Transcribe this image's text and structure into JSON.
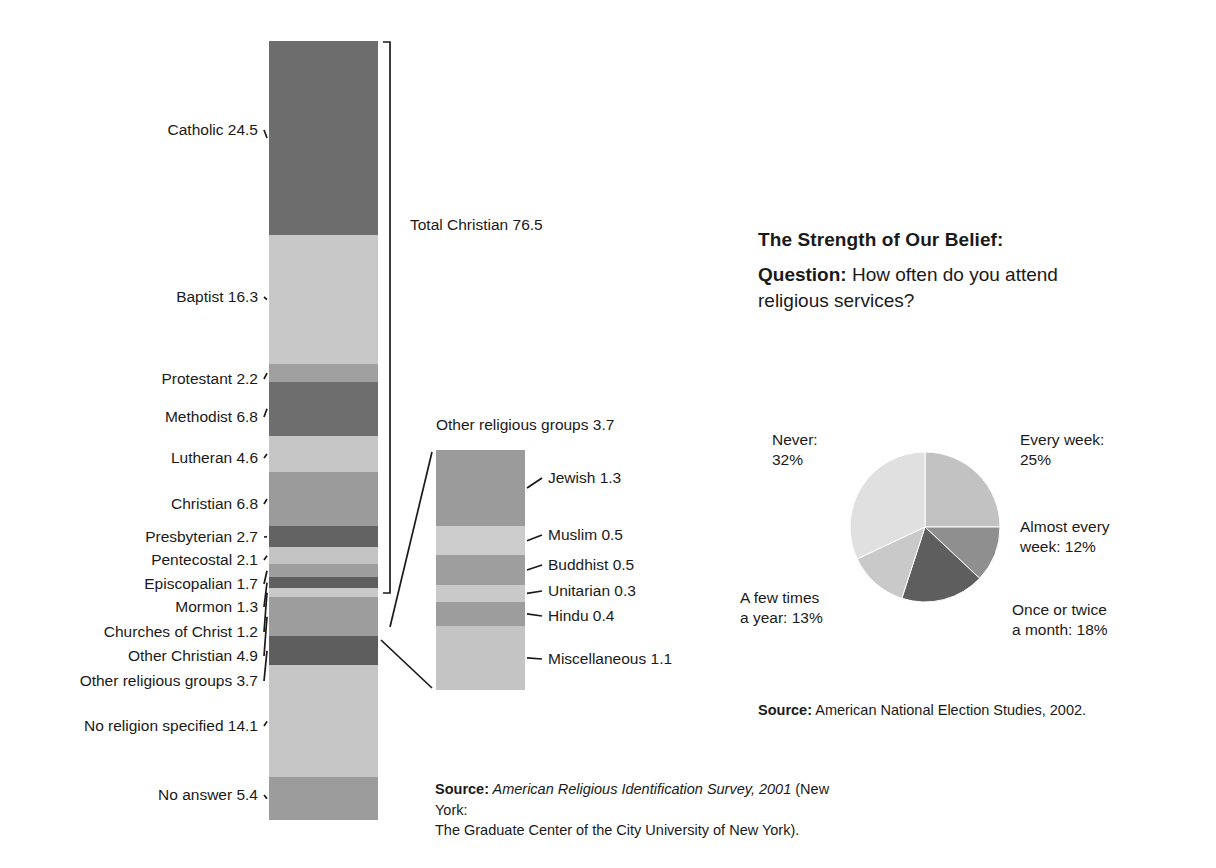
{
  "chart_data": [
    {
      "type": "bar",
      "subtype": "stacked-vertical",
      "title": "Religious identification of U.S. adults (percent)",
      "total": 100.0,
      "categories": [
        "Catholic",
        "Baptist",
        "Protestant",
        "Methodist",
        "Lutheran",
        "Christian",
        "Presbyterian",
        "Pentecostal",
        "Episcopalian",
        "Mormon",
        "Churches of Christ",
        "Other Christian",
        "Other religious groups",
        "No religion specified",
        "No answer"
      ],
      "values": [
        24.5,
        16.3,
        2.2,
        6.8,
        4.6,
        6.8,
        2.7,
        2.1,
        1.7,
        1.3,
        1.2,
        4.9,
        3.7,
        14.1,
        5.4
      ],
      "colors": [
        "#6d6d6d",
        "#c8c8c8",
        "#a0a0a0",
        "#6e6e6e",
        "#c6c6c6",
        "#9b9b9b",
        "#636363",
        "#c4c4c4",
        "#9e9e9e",
        "#5f5f5f",
        "#c9c9c9",
        "#9d9d9d",
        "#5e5e5e",
        "#c6c6c6",
        "#9c9c9c"
      ],
      "bracket_label": "Total Christian 76.5",
      "bracket_value": 76.5,
      "xlabel": "",
      "ylabel": "",
      "grid": false,
      "legend": "none"
    },
    {
      "type": "bar",
      "subtype": "stacked-vertical",
      "title": "Other religious groups 3.7",
      "total": 3.7,
      "categories": [
        "Jewish",
        "Muslim",
        "Buddhist",
        "Unitarian",
        "Hindu",
        "Miscellaneous"
      ],
      "values": [
        1.3,
        0.5,
        0.5,
        0.3,
        0.4,
        1.1
      ],
      "colors": [
        "#9b9b9b",
        "#cccccc",
        "#9e9e9e",
        "#c9c9c9",
        "#9d9d9d",
        "#c4c4c4"
      ],
      "xlabel": "",
      "ylabel": "",
      "grid": false,
      "legend": "none"
    },
    {
      "type": "pie",
      "title": "The Strength of Our Belief:",
      "question": "How often do you attend religious services?",
      "categories": [
        "Every week",
        "Almost every week",
        "Once or twice a month",
        "A few times a year",
        "Never"
      ],
      "values": [
        25,
        12,
        18,
        13,
        32
      ],
      "unit": "%",
      "colors": [
        "#c2c2c2",
        "#8f8f8f",
        "#5e5e5e",
        "#c9c9c9",
        "#e0e0e0"
      ],
      "legend": "callout-labels"
    }
  ],
  "main_bar": {
    "bracket_label": "Total Christian 76.5",
    "segments": [
      {
        "label": "Catholic 24.5",
        "value": 24.5,
        "color": "#6d6d6d"
      },
      {
        "label": "Baptist 16.3",
        "value": 16.3,
        "color": "#c8c8c8"
      },
      {
        "label": "Protestant 2.2",
        "value": 2.2,
        "color": "#a0a0a0"
      },
      {
        "label": "Methodist 6.8",
        "value": 6.8,
        "color": "#6e6e6e"
      },
      {
        "label": "Lutheran 4.6",
        "value": 4.6,
        "color": "#c6c6c6"
      },
      {
        "label": "Christian 6.8",
        "value": 6.8,
        "color": "#9b9b9b"
      },
      {
        "label": "Presbyterian 2.7",
        "value": 2.7,
        "color": "#636363"
      },
      {
        "label": "Pentecostal 2.1",
        "value": 2.1,
        "color": "#c4c4c4"
      },
      {
        "label": "Episcopalian 1.7",
        "value": 1.7,
        "color": "#9e9e9e"
      },
      {
        "label": "Mormon 1.3",
        "value": 1.3,
        "color": "#5f5f5f"
      },
      {
        "label": "Churches of Christ 1.2",
        "value": 1.2,
        "color": "#c9c9c9"
      },
      {
        "label": "Other Christian 4.9",
        "value": 4.9,
        "color": "#9d9d9d"
      },
      {
        "label": "Other religious groups 3.7",
        "value": 3.7,
        "color": "#5e5e5e"
      },
      {
        "label": "No religion specified 14.1",
        "value": 14.1,
        "color": "#c6c6c6"
      },
      {
        "label": "No answer 5.4",
        "value": 5.4,
        "color": "#9c9c9c"
      }
    ]
  },
  "sub_bar": {
    "title": "Other religious groups 3.7",
    "segments": [
      {
        "label": "Jewish 1.3",
        "value": 1.3,
        "color": "#9b9b9b"
      },
      {
        "label": "Muslim 0.5",
        "value": 0.5,
        "color": "#cccccc"
      },
      {
        "label": "Buddhist 0.5",
        "value": 0.5,
        "color": "#9e9e9e"
      },
      {
        "label": "Unitarian 0.3",
        "value": 0.3,
        "color": "#c9c9c9"
      },
      {
        "label": "Hindu 0.4",
        "value": 0.4,
        "color": "#9d9d9d"
      },
      {
        "label": "Miscellaneous 1.1",
        "value": 1.1,
        "color": "#c4c4c4"
      }
    ]
  },
  "belief": {
    "title": "The Strength of Our Belief:",
    "question_prefix": "Question:",
    "question_text": " How often do you attend religious services?",
    "slices": [
      {
        "label": "Every week:\n25%",
        "value": 25,
        "color": "#c2c2c2"
      },
      {
        "label": "Almost every\nweek: 12%",
        "value": 12,
        "color": "#8f8f8f"
      },
      {
        "label": "Once or twice\na month: 18%",
        "value": 18,
        "color": "#5e5e5e"
      },
      {
        "label": "A few times\na year: 13%",
        "value": 13,
        "color": "#c9c9c9"
      },
      {
        "label": "Never:\n32%",
        "value": 32,
        "color": "#e0e0e0"
      }
    ]
  },
  "sources": {
    "bar_prefix": "Source:",
    "bar_italic": " American Religious Identification Survey, 2001",
    "bar_rest": " (New York:",
    "bar_line2": "The Graduate Center of the City University of New York).",
    "pie_prefix": "Source:",
    "pie_rest": " American National Election Studies, 2002."
  }
}
